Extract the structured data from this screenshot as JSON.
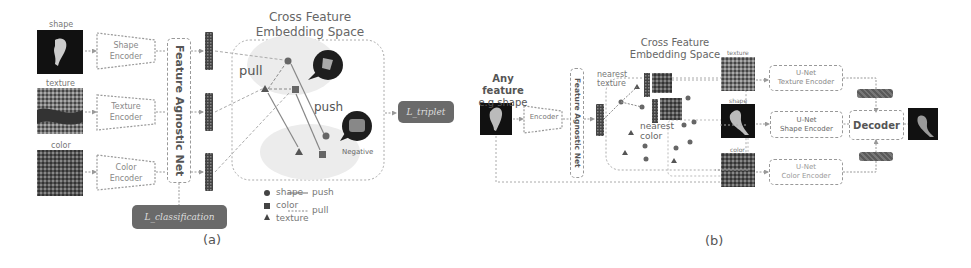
{
  "panel_a": {
    "label": "(a)",
    "inputs": [
      {
        "caption": "shape",
        "encoder_line1": "Shape",
        "encoder_line2": "Encoder"
      },
      {
        "caption": "texture",
        "encoder_line1": "Texture",
        "encoder_line2": "Encoder"
      },
      {
        "caption": "color",
        "encoder_line1": "Color",
        "encoder_line2": "Encoder"
      }
    ],
    "agnostic_net": "Feature Agnostic Net",
    "embedding_title_line1": "Cross Feature",
    "embedding_title_line2": "Embedding Space",
    "pull_label": "pull",
    "push_label": "push",
    "negative_label": "Negative",
    "loss_triplet": "L_triplet",
    "loss_classification": "L_classification",
    "stray_glyph": "",
    "legend": {
      "shape": "shape",
      "color": "color",
      "texture": "texture",
      "push": "push",
      "pull": "pull"
    }
  },
  "panel_b": {
    "label": "(b)",
    "input_line1": "Any feature",
    "input_line2": "e.g shape",
    "encoder": "Encoder",
    "agnostic_net": "Feature Agnostic Net",
    "embedding_title_line1": "Cross Feature",
    "embedding_title_line2": "Embedding Space",
    "nearest_texture_line1": "nearest",
    "nearest_texture_line2": "texture",
    "nearest_color_line1": "nearest",
    "nearest_color_line2": "color",
    "retrieved": [
      {
        "caption": "texture",
        "unet_line1": "U-Net",
        "unet_line2": "Texture Encoder"
      },
      {
        "caption": "shape",
        "unet_line1": "U-Net",
        "unet_line2": "Shape Encoder"
      },
      {
        "caption": "color",
        "unet_line1": "U-Net",
        "unet_line2": "Color Encoder"
      }
    ],
    "decoder": "Decoder",
    "norm_label_top": "",
    "norm_label_bottom": ""
  }
}
